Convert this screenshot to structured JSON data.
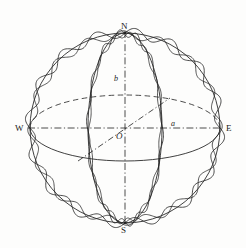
{
  "figure": {
    "background_color": "#fdfdfc",
    "line_color": "#1f1f1f",
    "labels": {
      "north": "N",
      "south": "S",
      "west": "W",
      "east": "E",
      "center": "O",
      "semi_major": "a",
      "semi_minor": "b"
    }
  },
  "chart_data": {
    "type": "line",
    "xlabel": "",
    "ylabel": "",
    "grid": false,
    "legend_position": "none",
    "annotations": [
      {
        "text": "N",
        "x": 125,
        "y": 30,
        "meaning": "north-pole"
      },
      {
        "text": "S",
        "x": 124,
        "y": 222,
        "meaning": "south-pole"
      },
      {
        "text": "W",
        "x": 21,
        "y": 129,
        "meaning": "west-point"
      },
      {
        "text": "E",
        "x": 230,
        "y": 129,
        "meaning": "east-point"
      },
      {
        "text": "O",
        "x": 119,
        "y": 136,
        "meaning": "center-origin"
      },
      {
        "text": "a",
        "x": 173,
        "y": 125,
        "meaning": "equatorial-semi-axis"
      },
      {
        "text": "b",
        "x": 116,
        "y": 79,
        "meaning": "polar-semi-axis"
      }
    ],
    "geometry": {
      "center": [
        125,
        128
      ],
      "sphere_radius_x": 95,
      "sphere_radius_y": 95,
      "equator_ellipse": {
        "cx": 125,
        "cy": 128,
        "rx": 95,
        "ry": 33
      },
      "meridian_ellipse": {
        "cx": 125,
        "cy": 128,
        "rx": 37,
        "ry": 95
      },
      "axes": [
        {
          "name": "west-east-axis",
          "from": [
            30,
            128
          ],
          "to": [
            220,
            128
          ],
          "style": "dash-dot"
        },
        {
          "name": "north-south-axis",
          "from": [
            125,
            33
          ],
          "to": [
            125,
            223
          ],
          "style": "dash-dot"
        },
        {
          "name": "oblique-axis",
          "from": [
            78,
            160
          ],
          "to": [
            169,
            99
          ],
          "style": "dash-dot"
        }
      ],
      "perturbation": {
        "description": "rippled oscillation superimposed on outline and meridian",
        "outer_mode_count": 16,
        "outer_amplitude": 5,
        "meridian_mode_count": 14,
        "meridian_amplitude": 4
      }
    },
    "series": [
      {
        "name": "sphere-outline",
        "style": "solid"
      },
      {
        "name": "outer-perturbation-wave",
        "style": "solid-wavy"
      },
      {
        "name": "equator-front-arc",
        "style": "solid"
      },
      {
        "name": "equator-back-arc",
        "style": "dashed"
      },
      {
        "name": "meridian-ellipse",
        "style": "solid"
      },
      {
        "name": "meridian-perturbation-wave",
        "style": "solid-wavy"
      },
      {
        "name": "west-east-axis",
        "style": "dash-dot"
      },
      {
        "name": "north-south-axis",
        "style": "dash-dot"
      },
      {
        "name": "oblique-axis",
        "style": "dash-dot"
      }
    ]
  }
}
